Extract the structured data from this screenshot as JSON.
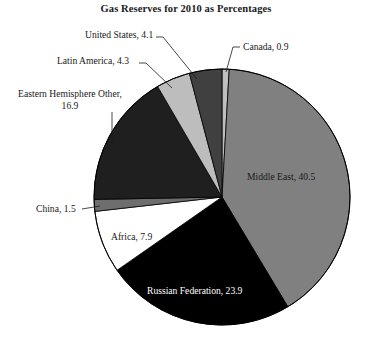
{
  "chart_data": {
    "type": "pie",
    "title": "Gas Reserves for 2010 as Percentages",
    "subtitle": "",
    "xlabel": "",
    "ylabel": "",
    "units": "percent",
    "legend": "none (direct slice labels with leader lines)",
    "total": 100.0,
    "start_angle_deg": 0,
    "direction": "clockwise from 12 o'clock",
    "categories": [
      "Canada",
      "Middle East",
      "Russian Federation",
      "Africa",
      "China",
      "Eastern Hemisphere Other",
      "Latin America",
      "United States"
    ],
    "values": [
      0.9,
      40.5,
      23.9,
      7.9,
      1.5,
      16.9,
      4.3,
      4.1
    ],
    "colors": [
      "#c0c0c0",
      "#808080",
      "#000000",
      "#ffffff",
      "#6e6e6e",
      "#1f1f1f",
      "#bdbdbd",
      "#404040"
    ],
    "slices": [
      {
        "label": "Canada",
        "value": 0.9,
        "value_text": "0.9",
        "label_text": "Canada, 0.9",
        "color": "#c0c0c0",
        "label_placement": "outside",
        "leader_line": true,
        "text_color": "#1a1a1a"
      },
      {
        "label": "Middle East",
        "value": 40.5,
        "value_text": "40.5",
        "label_text": "Middle East, 40.5",
        "color": "#808080",
        "label_placement": "inside",
        "leader_line": false,
        "text_color": "#1a1a1a"
      },
      {
        "label": "Russian Federation",
        "value": 23.9,
        "value_text": "23.9",
        "label_text": "Russian Federation, 23.9",
        "color": "#000000",
        "label_placement": "inside",
        "leader_line": false,
        "text_color": "#ffffff"
      },
      {
        "label": "Africa",
        "value": 7.9,
        "value_text": "7.9",
        "label_text": "Africa, 7.9",
        "color": "#ffffff",
        "label_placement": "inside",
        "leader_line": false,
        "text_color": "#1a1a1a"
      },
      {
        "label": "China",
        "value": 1.5,
        "value_text": "1.5",
        "label_text": "China, 1.5",
        "color": "#6e6e6e",
        "label_placement": "outside",
        "leader_line": true,
        "text_color": "#1a1a1a"
      },
      {
        "label": "Eastern Hemisphere Other",
        "value": 16.9,
        "value_text": "16.9",
        "label_text": "Eastern Hemisphere Other, 16.9",
        "color": "#1f1f1f",
        "label_placement": "outside",
        "leader_line": true,
        "text_color": "#1a1a1a"
      },
      {
        "label": "Latin America",
        "value": 4.3,
        "value_text": "4.3",
        "label_text": "Latin America, 4.3",
        "color": "#bdbdbd",
        "label_placement": "outside",
        "leader_line": true,
        "text_color": "#1a1a1a"
      },
      {
        "label": "United States",
        "value": 4.1,
        "value_text": "4.1",
        "label_text": "United States, 4.1",
        "color": "#404040",
        "label_placement": "outside",
        "leader_line": true,
        "text_color": "#1a1a1a"
      }
    ]
  },
  "title": {
    "text": "Gas Reserves for 2010 as Percentages"
  },
  "labels": {
    "united_states": "United States, 4.1",
    "canada": "Canada, 0.9",
    "latin_america": "Latin America, 4.3",
    "eastern_other_line1": "Eastern Hemisphere Other,",
    "eastern_other_line2": "16.9",
    "china": "China, 1.5",
    "africa": "Africa, 7.9",
    "russian_federation": "Russian Federation, 23.9",
    "middle_east": "Middle East, 40.5"
  },
  "style": {
    "background": "#ffffff",
    "outline": "#000000",
    "text": "#1a1a1a",
    "text_on_dark": "#ffffff"
  }
}
